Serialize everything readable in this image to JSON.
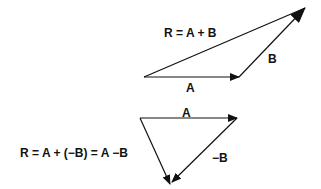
{
  "diagram": {
    "top": {
      "equation": "R = A + B",
      "label_a": "A",
      "label_b": "B",
      "vectors": {
        "A": {
          "from": [
            144,
            77
          ],
          "to": [
            239,
            77
          ]
        },
        "B": {
          "from": [
            239,
            77
          ],
          "to": [
            305,
            8
          ]
        },
        "R": {
          "from": [
            144,
            77
          ],
          "to": [
            305,
            8
          ]
        }
      }
    },
    "bottom": {
      "equation": "R = A + (−B) = A −B",
      "label_a": "A",
      "label_neg_b": "−B",
      "vectors": {
        "A": {
          "from": [
            140,
            118
          ],
          "to": [
            237,
            118
          ]
        },
        "negB": {
          "from": [
            237,
            118
          ],
          "to": [
            170,
            184
          ]
        },
        "R": {
          "from": [
            140,
            118
          ],
          "to": [
            170,
            184
          ]
        }
      }
    },
    "colors": {
      "line": "#111111",
      "background": "#ffffff"
    }
  }
}
